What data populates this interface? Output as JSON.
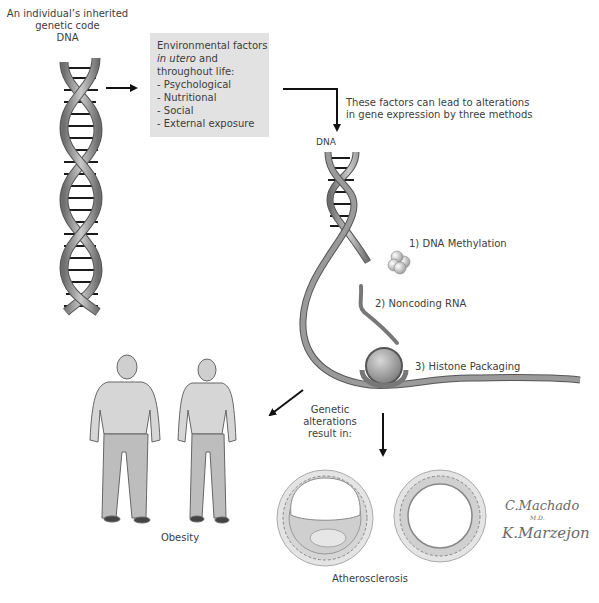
{
  "top_left": {
    "line1": "An individual’s inherited",
    "line2": "genetic code",
    "line3": "DNA"
  },
  "environment_box": {
    "title1": "Environmental factors",
    "title2_italic": "in utero",
    "title2_rest": " and",
    "title3": "throughout life:",
    "items": [
      "- Psychological",
      "- Nutritional",
      "- Social",
      "- External exposure"
    ]
  },
  "factors_note": {
    "line1": "These factors can lead to alterations",
    "line2": "in gene expression by three methods"
  },
  "dna_label_2": "DNA",
  "methods": [
    {
      "label": "1) DNA Methylation"
    },
    {
      "label": "2) Noncoding RNA"
    },
    {
      "label": "3) Histone Packaging"
    }
  ],
  "result_note": {
    "line1": "Genetic",
    "line2": "alterations",
    "line3": "result in:"
  },
  "outcomes": {
    "obesity": "Obesity",
    "atherosclerosis": "Atherosclerosis"
  },
  "signatures": {
    "sig1": "C.Machado",
    "sig1_sub": "M.D.",
    "sig2": "K.Marzejon"
  },
  "colors": {
    "box_bg": "#e2e2e2",
    "arrow": "#111111",
    "ribbon": "#8a8a8a"
  }
}
